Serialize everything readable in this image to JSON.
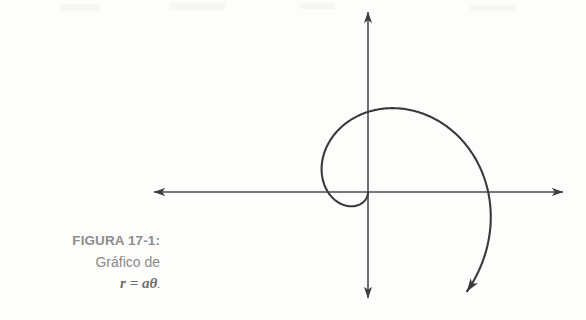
{
  "figure": {
    "label": "FIGURA 17-1:",
    "description": "Gráfico de",
    "formula": "r = aθ",
    "formula_terminator": ".",
    "label_color": "#8d8d8d",
    "description_color": "#8a8a8a",
    "formula_color": "#6e6e6e"
  },
  "page": {
    "background_color": "#fdfdfc",
    "width": 586,
    "height": 320
  },
  "chart_data": {
    "type": "line",
    "title": "",
    "subtitle": "",
    "xlabel": "",
    "ylabel": "",
    "grid": false,
    "legend": null,
    "equation": "r = a*theta",
    "coordinate_system": "polar",
    "stroke_color": "#3a3a3c",
    "axis_color": "#4a4a4c",
    "stroke_width": 2.1,
    "axis_width": 1.5,
    "origin": {
      "x": 368,
      "y": 192
    },
    "axes": {
      "x_axis": {
        "x_start": 152,
        "x_end": 565,
        "y": 192,
        "arrows": [
          "left",
          "right"
        ]
      },
      "y_axis": {
        "y_start": 10,
        "y_end": 300,
        "x": 368,
        "arrows": [
          "up",
          "down"
        ]
      }
    },
    "spiral": {
      "a_pixels_per_radian": 25.5,
      "theta_start_deg": 0,
      "theta_end_deg": 315,
      "direction": "counterclockwise",
      "arrow_at": "theta_end",
      "key_points": [
        {
          "theta_deg": 0,
          "r_px": 0,
          "x": 368,
          "y": 192,
          "note": "origin / pole"
        },
        {
          "theta_deg": 90,
          "r_px": 40,
          "x": 368,
          "y": 232,
          "note": "inner loop bottom"
        },
        {
          "theta_deg": 180,
          "r_px": 80,
          "x": 348,
          "y": 212,
          "note": "inner loop left"
        },
        {
          "theta_deg": 270,
          "r_px": 120,
          "x": 437,
          "y": 192,
          "note": "crosses +x axis"
        },
        {
          "theta_deg": 300,
          "r_px": 133,
          "x": 427,
          "y": 120,
          "note": "upper right arc"
        },
        {
          "theta_deg": 360,
          "r_px": 160,
          "x": 355,
          "y": 86,
          "note": "apex of outer arc"
        },
        {
          "theta_deg": 450,
          "r_px": 200,
          "x": 228,
          "y": 192,
          "note": "arrow terminus on -x axis"
        }
      ],
      "x_axis_crossings": [
        437,
        228
      ],
      "apex": {
        "x": 355,
        "y": 86
      },
      "inner_loop": {
        "left_x": 348,
        "bottom_y": 228,
        "right_x": 437
      }
    }
  }
}
